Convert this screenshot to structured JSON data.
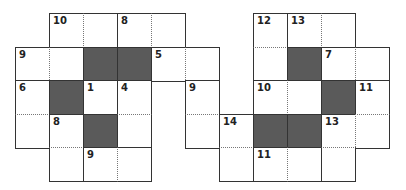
{
  "puzzle": {
    "type": "crossword-grid",
    "cell_size": 34,
    "origin": {
      "x": 15,
      "y": 13
    },
    "colors": {
      "black_cell": "#5a5a5a",
      "border": "#333333",
      "dotted": "#777777"
    },
    "cells": [
      {
        "c": 1,
        "r": 0,
        "num": "10"
      },
      {
        "c": 2,
        "r": 0,
        "num": "",
        "dl": 1
      },
      {
        "c": 3,
        "r": 0,
        "num": "8"
      },
      {
        "c": 4,
        "r": 0,
        "num": "",
        "dl": 1
      },
      {
        "c": 7,
        "r": 0,
        "num": "12"
      },
      {
        "c": 8,
        "r": 0,
        "num": "13"
      },
      {
        "c": 9,
        "r": 0,
        "num": "",
        "dl": 1
      },
      {
        "c": 0,
        "r": 1,
        "num": "9"
      },
      {
        "c": 1,
        "r": 1,
        "num": "",
        "dl": 1
      },
      {
        "c": 2,
        "r": 1,
        "black": 1
      },
      {
        "c": 3,
        "r": 1,
        "black": 1
      },
      {
        "c": 4,
        "r": 1,
        "num": "5"
      },
      {
        "c": 5,
        "r": 1,
        "num": "",
        "dl": 1
      },
      {
        "c": 7,
        "r": 1,
        "num": "",
        "dt": 1
      },
      {
        "c": 8,
        "r": 1,
        "black": 1
      },
      {
        "c": 9,
        "r": 1,
        "num": "7"
      },
      {
        "c": 10,
        "r": 1,
        "num": "",
        "dl": 1
      },
      {
        "c": 0,
        "r": 2,
        "num": "6"
      },
      {
        "c": 1,
        "r": 2,
        "black": 1
      },
      {
        "c": 2,
        "r": 2,
        "num": "1"
      },
      {
        "c": 3,
        "r": 2,
        "num": "4"
      },
      {
        "c": 5,
        "r": 2,
        "num": "9"
      },
      {
        "c": 7,
        "r": 2,
        "num": "10"
      },
      {
        "c": 8,
        "r": 2,
        "num": "",
        "dl": 1
      },
      {
        "c": 9,
        "r": 2,
        "black": 1
      },
      {
        "c": 10,
        "r": 2,
        "num": "11"
      },
      {
        "c": 0,
        "r": 3,
        "num": "",
        "dt": 1
      },
      {
        "c": 1,
        "r": 3,
        "num": "8"
      },
      {
        "c": 2,
        "r": 3,
        "black": 1
      },
      {
        "c": 3,
        "r": 3,
        "num": "",
        "dt": 1
      },
      {
        "c": 5,
        "r": 3,
        "num": "",
        "dt": 1
      },
      {
        "c": 6,
        "r": 3,
        "num": "14"
      },
      {
        "c": 7,
        "r": 3,
        "black": 1
      },
      {
        "c": 8,
        "r": 3,
        "black": 1
      },
      {
        "c": 9,
        "r": 3,
        "num": "13"
      },
      {
        "c": 10,
        "r": 3,
        "num": "",
        "dt": 1,
        "dl": 1
      },
      {
        "c": 1,
        "r": 4,
        "num": "",
        "dt": 1
      },
      {
        "c": 2,
        "r": 4,
        "num": "9"
      },
      {
        "c": 3,
        "r": 4,
        "num": "",
        "dl": 1
      },
      {
        "c": 6,
        "r": 4,
        "num": "",
        "dt": 1
      },
      {
        "c": 7,
        "r": 4,
        "num": "11"
      },
      {
        "c": 8,
        "r": 4,
        "num": "",
        "dl": 1
      },
      {
        "c": 9,
        "r": 4,
        "num": "",
        "dt": 1
      }
    ]
  }
}
